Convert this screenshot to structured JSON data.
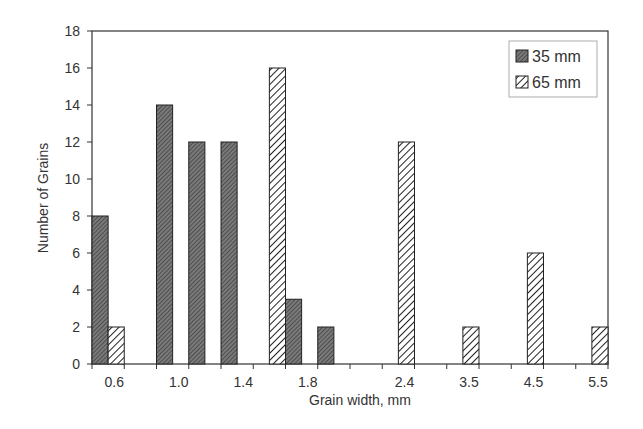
{
  "chart_data": {
    "type": "bar",
    "title": "",
    "xlabel": "Grain width, mm",
    "ylabel": "Number of Grains",
    "ylim": [
      0,
      18
    ],
    "yticks": [
      0,
      2,
      4,
      6,
      8,
      10,
      12,
      14,
      16,
      18
    ],
    "grid": false,
    "legend_position": "top-right",
    "x_tick_labels": [
      "0.6",
      "1.0",
      "1.4",
      "1.8",
      "2.4",
      "3.5",
      "4.5",
      "5.5"
    ],
    "slots": 16,
    "bars": [
      {
        "series": "35 mm",
        "slot": 0,
        "half": 0,
        "value": 8
      },
      {
        "series": "65 mm",
        "slot": 0,
        "half": 1,
        "value": 2
      },
      {
        "series": "35 mm",
        "slot": 2,
        "half": 0,
        "value": 14
      },
      {
        "series": "35 mm",
        "slot": 3,
        "half": 0,
        "value": 12
      },
      {
        "series": "35 mm",
        "slot": 4,
        "half": 0,
        "value": 12
      },
      {
        "series": "65 mm",
        "slot": 5,
        "half": 1,
        "value": 16
      },
      {
        "series": "35 mm",
        "slot": 6,
        "half": 0,
        "value": 3.5
      },
      {
        "series": "35 mm",
        "slot": 7,
        "half": 0,
        "value": 2
      },
      {
        "series": "65 mm",
        "slot": 9,
        "half": 1,
        "value": 12
      },
      {
        "series": "65 mm",
        "slot": 11,
        "half": 1,
        "value": 2
      },
      {
        "series": "65 mm",
        "slot": 13,
        "half": 1,
        "value": 6
      },
      {
        "series": "65 mm",
        "slot": 15,
        "half": 1,
        "value": 2
      }
    ],
    "series": [
      {
        "name": "35 mm",
        "fill": "dense-dark-hatch",
        "color": "#666666"
      },
      {
        "name": "65 mm",
        "fill": "diagonal-stripes",
        "color": "#ffffff"
      }
    ]
  },
  "legend": {
    "items": [
      "35 mm",
      "65 mm"
    ]
  }
}
